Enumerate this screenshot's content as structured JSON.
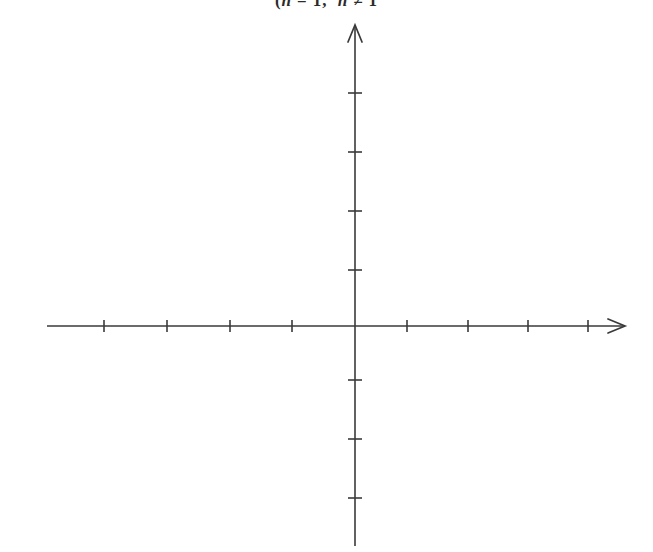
{
  "figure": {
    "type": "blank-cartesian-axes",
    "width": 653,
    "height": 552,
    "background_color": "#ffffff",
    "ink_color": "#3a3a3a"
  },
  "heading": {
    "visible_text": "(n = 1,  n ≠ 1",
    "note": "partially cropped at top edge of page",
    "segment_open_paren": "(",
    "segment_var_one": "n",
    "segment_eq": "= 1,",
    "segment_var_two": "n",
    "segment_neq": "≠ 1"
  },
  "chart_data": {
    "type": "scatter",
    "title": "",
    "subtitle": "",
    "xlabel": "",
    "ylabel": "",
    "series": [
      {
        "name": "empty",
        "x": [],
        "y": []
      }
    ],
    "grid": false,
    "legend": null,
    "legend_position": "none",
    "xlim": [
      -5,
      5
    ],
    "ylim": [
      -4,
      5
    ],
    "x_tick_labels": [],
    "y_tick_labels": [],
    "x_major_ticks": [
      -4,
      -3,
      -2,
      -1,
      1,
      2,
      3,
      4
    ],
    "y_major_ticks": [
      4,
      3,
      2,
      1,
      -1,
      -2,
      -3
    ],
    "annotations": []
  },
  "geometry": {
    "origin_x": 355,
    "origin_y": 326,
    "x_axis_start_x": 47,
    "x_axis_end_x": 625,
    "y_axis_top_y": 25,
    "y_axis_bottom_y": 546,
    "x_tick_positions": [
      104,
      167,
      230,
      292,
      407,
      468,
      528,
      588
    ],
    "y_tick_positions": [
      93,
      152,
      211,
      270,
      380,
      439,
      498
    ],
    "x_tick_half_height": 6,
    "y_tick_half_width": 7,
    "stroke_width": 1.6,
    "arrow_length": 17,
    "arrow_half_width": 7
  },
  "axes": {
    "x_axis_name": "horizontal-axis",
    "y_axis_name": "vertical-axis",
    "x_arrow_direction": "right",
    "y_arrow_direction": "up",
    "x_axis_has_left_arrow": false,
    "y_axis_has_bottom_arrow": false
  }
}
